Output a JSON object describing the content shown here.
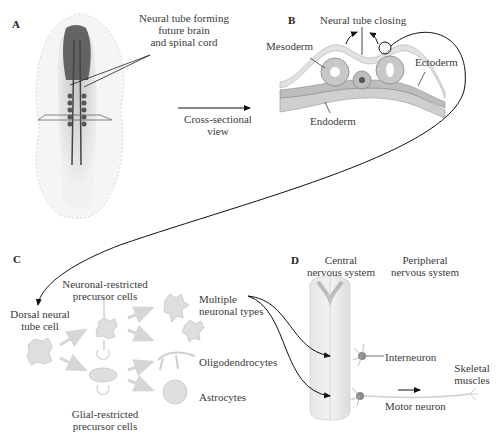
{
  "panels": {
    "A": {
      "letter": "A",
      "label_line1": "Neural tube forming",
      "label_line2": "future brain",
      "label_line3": "and spinal cord"
    },
    "arrow_AB": {
      "label_line1": "Cross-sectional",
      "label_line2": "view"
    },
    "B": {
      "letter": "B",
      "title": "Neural tube closing",
      "mesoderm": "Mesoderm",
      "ectoderm": "Ectoderm",
      "endoderm": "Endoderm"
    },
    "C": {
      "letter": "C",
      "dorsal_line1": "Dorsal neural",
      "dorsal_line2": "tube cell",
      "neuronal_line1": "Neuronal-restricted",
      "neuronal_line2": "precursor cells",
      "glial_line1": "Glial-restricted",
      "glial_line2": "precursor cells",
      "multiple_line1": "Multiple",
      "multiple_line2": "neuronal types",
      "oligodendrocytes": "Oligodendrocytes",
      "astrocytes": "Astrocytes"
    },
    "D": {
      "letter": "D",
      "cns_line1": "Central",
      "cns_line2": "nervous system",
      "pns_line1": "Peripheral",
      "pns_line2": "nervous system",
      "interneuron": "Interneuron",
      "motor_neuron": "Motor neuron",
      "skeletal_line1": "Skeletal",
      "skeletal_line2": "muscles"
    }
  },
  "colors": {
    "line": "#111111",
    "tissue_light": "#e4e4e4",
    "tissue_mid": "#bdbdbd",
    "tissue_dark": "#555555",
    "neuron": "#9a9a9a"
  }
}
